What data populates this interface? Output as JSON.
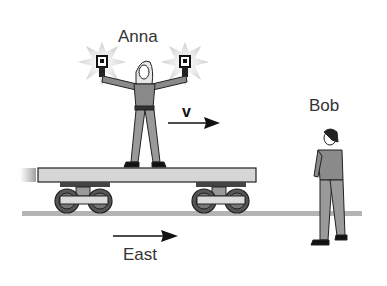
{
  "labels": {
    "anna": "Anna",
    "bob": "Bob",
    "velocity": "v",
    "direction": "East"
  },
  "colors": {
    "figure_fill": "#8a8a8a",
    "cart_deck": "#d4d4d4",
    "track": "#b4b4b4",
    "wheel": "#555555",
    "flash": "#d8d8d8",
    "outline": "#222222"
  }
}
